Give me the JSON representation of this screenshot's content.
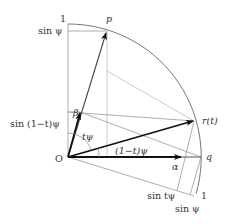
{
  "diagram": {
    "type": "slerp-geometry",
    "origin_label": "O",
    "points": {
      "p": "p",
      "q": "q",
      "r": "r(t)"
    },
    "vectors": {
      "alpha": "α",
      "beta": "β"
    },
    "angles": {
      "t_psi": "tψ",
      "one_minus_t_psi": "(1−t)ψ"
    },
    "axis_labels": {
      "vertical_one": "1",
      "vertical_sin_psi": "sin ψ",
      "vertical_sin_1mt_psi": "sin (1−t)ψ",
      "rotated_one": "1",
      "rotated_sin_t_psi": "sin tψ",
      "rotated_sin_psi": "sin ψ"
    },
    "colors": {
      "thin_line": "#9a9a9a",
      "arc": "#777777",
      "arrow": "#111111",
      "text": "#333333"
    }
  }
}
